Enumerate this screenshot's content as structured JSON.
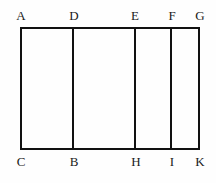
{
  "figure": {
    "name": "partitioned-rectangle-diagram",
    "background_color": "#fefefe",
    "stroke_color": "#111111",
    "stroke_width": 2,
    "outline": {
      "left": 21,
      "right": 199,
      "top": 28,
      "bottom": 149
    },
    "divider_lines": [
      {
        "id": "divider-DB",
        "x": 73,
        "top_label": "D",
        "bottom_label": "B"
      },
      {
        "id": "divider-EH",
        "x": 135,
        "top_label": "E",
        "bottom_label": "H"
      },
      {
        "id": "divider-FI",
        "x": 171,
        "top_label": "F",
        "bottom_label": "I"
      }
    ],
    "top_labels": [
      {
        "text": "A",
        "x": 21,
        "y": 9
      },
      {
        "text": "D",
        "x": 74,
        "y": 9
      },
      {
        "text": "E",
        "x": 135,
        "y": 9
      },
      {
        "text": "F",
        "x": 172,
        "y": 9
      },
      {
        "text": "G",
        "x": 200,
        "y": 9
      }
    ],
    "bottom_labels": [
      {
        "text": "C",
        "x": 21,
        "y": 155
      },
      {
        "text": "B",
        "x": 74,
        "y": 155
      },
      {
        "text": "H",
        "x": 136,
        "y": 155
      },
      {
        "text": "I",
        "x": 172,
        "y": 155
      },
      {
        "text": "K",
        "x": 200,
        "y": 155
      }
    ]
  }
}
